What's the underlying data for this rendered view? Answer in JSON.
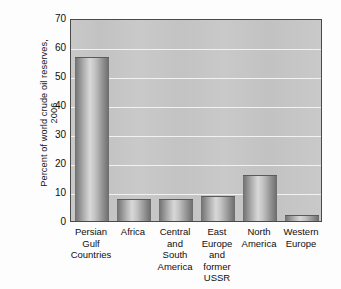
{
  "chart_data": {
    "type": "bar",
    "title": "",
    "xlabel": "",
    "ylabel": "Percent of world crude oil reserves, 2006",
    "ylabel_lines": [
      "Percent of world crude oil reserves,",
      "2006"
    ],
    "ylim": [
      0,
      70
    ],
    "yticks": [
      70,
      60,
      50,
      40,
      30,
      20,
      10,
      0
    ],
    "ytick_labels": [
      "70",
      "60",
      "50",
      "40",
      "30",
      "20",
      "10",
      "0"
    ],
    "grid": true,
    "grid_axis": "y",
    "legend": false,
    "categories": [
      "Persian Gulf Countries",
      "Africa",
      "Central and South America",
      "East Europe and former USSR",
      "North America",
      "Western Europe"
    ],
    "category_label_lines": [
      [
        "Persian",
        "Gulf",
        "Countries"
      ],
      [
        "Africa"
      ],
      [
        "Central",
        "and",
        "South",
        "America"
      ],
      [
        "East",
        "Europe",
        "and",
        "former",
        "USSR"
      ],
      [
        "North",
        "America"
      ],
      [
        "Western",
        "Europe"
      ]
    ],
    "values": [
      56.5,
      7.5,
      7.5,
      8.5,
      16.0,
      2.0
    ],
    "series": [
      {
        "name": "Percent of world crude oil reserves, 2006",
        "values": [
          56.5,
          7.5,
          7.5,
          8.5,
          16.0,
          2.0
        ]
      }
    ],
    "colors": {
      "plot_background": "#c6c6c6",
      "gridline": "#f2f2f2",
      "axis_frame": "#4a4a4a",
      "bar_light": "#d8d8d8",
      "bar_dark": "#6f6f6f",
      "text": "#0f0f0f",
      "figure_background": "#fdfdfd"
    }
  }
}
